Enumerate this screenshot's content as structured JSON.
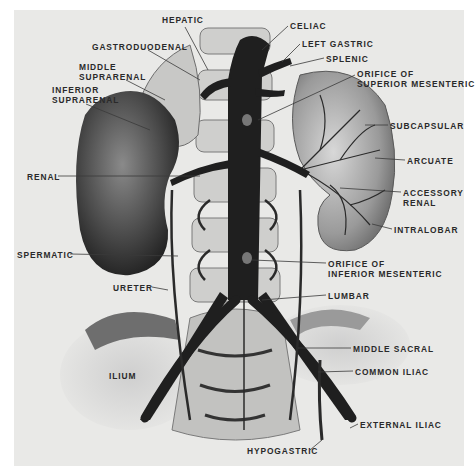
{
  "figure": {
    "background": "#e9e9e7",
    "ink": "#2a2a2a",
    "labels": [
      {
        "id": "hepatic",
        "lines": [
          "HEPATIC"
        ],
        "x": 162,
        "y": 15
      },
      {
        "id": "celiac",
        "lines": [
          "CELIAC"
        ],
        "x": 290,
        "y": 21
      },
      {
        "id": "gastroduodenal",
        "lines": [
          "GASTRODUODENAL"
        ],
        "x": 92,
        "y": 42
      },
      {
        "id": "left-gastric",
        "lines": [
          "LEFT GASTRIC"
        ],
        "x": 302,
        "y": 39
      },
      {
        "id": "splenic",
        "lines": [
          "SPLENIC"
        ],
        "x": 326,
        "y": 54
      },
      {
        "id": "middle-suprarenal",
        "lines": [
          "MIDDLE",
          "SUPRARENAL"
        ],
        "x": 79,
        "y": 62
      },
      {
        "id": "orifice-superior-mesenteric",
        "lines": [
          "ORIFICE OF",
          "SUPERIOR MESENTERIC"
        ],
        "x": 357,
        "y": 69
      },
      {
        "id": "inferior-suprarenal",
        "lines": [
          "INFERIOR",
          "SUPRARENAL"
        ],
        "x": 52,
        "y": 85
      },
      {
        "id": "subcapsular",
        "lines": [
          "SUBCAPSULAR"
        ],
        "x": 390,
        "y": 121
      },
      {
        "id": "arcuate",
        "lines": [
          "ARCUATE"
        ],
        "x": 407,
        "y": 156
      },
      {
        "id": "renal",
        "lines": [
          "RENAL"
        ],
        "x": 27,
        "y": 172
      },
      {
        "id": "accessory-renal",
        "lines": [
          "ACCESSORY",
          "RENAL"
        ],
        "x": 403,
        "y": 188
      },
      {
        "id": "intralobar",
        "lines": [
          "INTRALOBAR"
        ],
        "x": 394,
        "y": 225
      },
      {
        "id": "spermatic",
        "lines": [
          "SPERMATIC"
        ],
        "x": 17,
        "y": 250
      },
      {
        "id": "orifice-inferior-mesenteric",
        "lines": [
          "ORIFICE OF",
          "INFERIOR MESENTERIC"
        ],
        "x": 328,
        "y": 259
      },
      {
        "id": "ureter",
        "lines": [
          "URETER"
        ],
        "x": 113,
        "y": 283
      },
      {
        "id": "lumbar",
        "lines": [
          "LUMBAR"
        ],
        "x": 328,
        "y": 291
      },
      {
        "id": "middle-sacral",
        "lines": [
          "MIDDLE SACRAL"
        ],
        "x": 353,
        "y": 344
      },
      {
        "id": "ilium",
        "lines": [
          "ILIUM"
        ],
        "x": 109,
        "y": 371
      },
      {
        "id": "common-iliac",
        "lines": [
          "COMMON ILIAC"
        ],
        "x": 355,
        "y": 367
      },
      {
        "id": "external-iliac",
        "lines": [
          "EXTERNAL ILIAC"
        ],
        "x": 360,
        "y": 420
      },
      {
        "id": "hypogastric",
        "lines": [
          "HYPOGASTRIC"
        ],
        "x": 247,
        "y": 446
      }
    ],
    "leaders": [
      {
        "label": "hepatic",
        "points": [
          [
            185,
            27
          ],
          [
            208,
            70
          ]
        ]
      },
      {
        "label": "celiac",
        "points": [
          [
            288,
            26
          ],
          [
            262,
            50
          ]
        ]
      },
      {
        "label": "gastroduodenal",
        "points": [
          [
            148,
            50
          ],
          [
            200,
            80
          ]
        ]
      },
      {
        "label": "left-gastric",
        "points": [
          [
            300,
            44
          ],
          [
            282,
            62
          ]
        ]
      },
      {
        "label": "splenic",
        "points": [
          [
            324,
            58
          ],
          [
            290,
            66
          ]
        ]
      },
      {
        "label": "middle-suprarenal",
        "points": [
          [
            126,
            80
          ],
          [
            165,
            100
          ]
        ]
      },
      {
        "label": "orifice-superior-mesenteric",
        "points": [
          [
            355,
            75
          ],
          [
            258,
            120
          ]
        ]
      },
      {
        "label": "inferior-suprarenal",
        "points": [
          [
            86,
            104
          ],
          [
            150,
            130
          ]
        ]
      },
      {
        "label": "subcapsular",
        "points": [
          [
            388,
            125
          ],
          [
            365,
            125
          ]
        ]
      },
      {
        "label": "arcuate",
        "points": [
          [
            405,
            160
          ],
          [
            375,
            158
          ]
        ]
      },
      {
        "label": "renal",
        "points": [
          [
            58,
            176
          ],
          [
            200,
            176
          ]
        ]
      },
      {
        "label": "accessory-renal",
        "points": [
          [
            401,
            192
          ],
          [
            340,
            188
          ]
        ]
      },
      {
        "label": "intralobar",
        "points": [
          [
            392,
            229
          ],
          [
            372,
            224
          ]
        ]
      },
      {
        "label": "spermatic",
        "points": [
          [
            70,
            254
          ],
          [
            178,
            256
          ]
        ]
      },
      {
        "label": "orifice-inferior-mesenteric",
        "points": [
          [
            326,
            263
          ],
          [
            252,
            260
          ]
        ]
      },
      {
        "label": "ureter",
        "points": [
          [
            152,
            287
          ],
          [
            168,
            290
          ]
        ]
      },
      {
        "label": "lumbar",
        "points": [
          [
            326,
            295
          ],
          [
            262,
            300
          ]
        ]
      },
      {
        "label": "middle-sacral",
        "points": [
          [
            351,
            348
          ],
          [
            298,
            348
          ]
        ]
      },
      {
        "label": "common-iliac",
        "points": [
          [
            353,
            371
          ],
          [
            318,
            372
          ]
        ]
      },
      {
        "label": "external-iliac",
        "points": [
          [
            358,
            424
          ],
          [
            350,
            428
          ]
        ]
      },
      {
        "label": "hypogastric",
        "points": [
          [
            310,
            450
          ],
          [
            322,
            440
          ]
        ]
      }
    ]
  }
}
